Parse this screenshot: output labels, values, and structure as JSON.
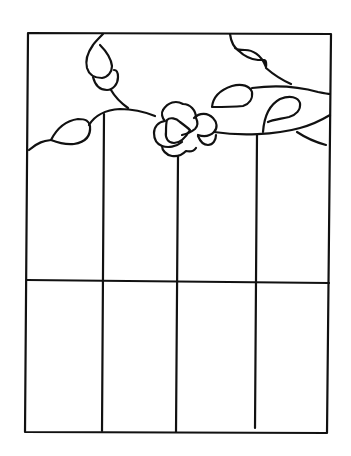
{
  "diagram": {
    "title": "Stained glass rose panel pattern",
    "type": "line-art pattern",
    "line_color": "#111111",
    "background_color": "#ffffff",
    "frame": {
      "x1": 28,
      "y1": 33,
      "x2": 330,
      "y2": 433
    },
    "horizontal_divider_y": 281,
    "vertical_dividers_x": [
      104,
      177,
      256
    ],
    "elements": [
      {
        "name": "rose",
        "type": "flower"
      },
      {
        "name": "leaf-upper-left"
      },
      {
        "name": "leaf-left"
      },
      {
        "name": "leaf-upper-right"
      },
      {
        "name": "leaf-center-right"
      },
      {
        "name": "leaf-right"
      },
      {
        "name": "vine-stem"
      }
    ]
  }
}
